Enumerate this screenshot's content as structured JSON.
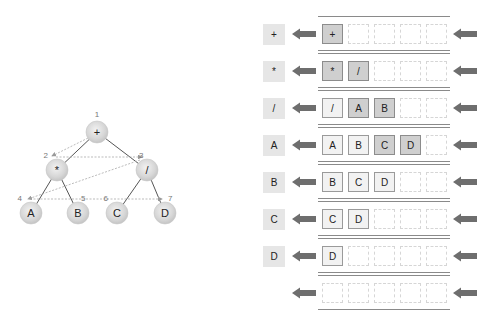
{
  "tree": {
    "nodes": [
      {
        "id": "plus",
        "label": "+",
        "order": "1",
        "x": 97,
        "y": 132
      },
      {
        "id": "mul",
        "label": "*",
        "order": "2",
        "x": 57,
        "y": 170
      },
      {
        "id": "div",
        "label": "/",
        "order": "3",
        "x": 147,
        "y": 170
      },
      {
        "id": "A",
        "label": "A",
        "order": "4",
        "x": 31,
        "y": 213
      },
      {
        "id": "B",
        "label": "B",
        "order": "5",
        "x": 78,
        "y": 213
      },
      {
        "id": "C",
        "label": "C",
        "order": "6",
        "x": 117,
        "y": 213
      },
      {
        "id": "D",
        "label": "D",
        "order": "7",
        "x": 165,
        "y": 213
      }
    ],
    "edges": [
      [
        "plus",
        "mul"
      ],
      [
        "plus",
        "div"
      ],
      [
        "mul",
        "A"
      ],
      [
        "mul",
        "B"
      ],
      [
        "div",
        "C"
      ],
      [
        "div",
        "D"
      ]
    ],
    "traversal_order": [
      "+",
      "*",
      "/",
      "A",
      "B",
      "C",
      "D"
    ]
  },
  "queue_steps": [
    {
      "output": "+",
      "cells": [
        {
          "v": "+",
          "s": "new"
        }
      ]
    },
    {
      "output": "*",
      "cells": [
        {
          "v": "*",
          "s": "new"
        },
        {
          "v": "/",
          "s": "new"
        }
      ]
    },
    {
      "output": "/",
      "cells": [
        {
          "v": "/",
          "s": "filled"
        },
        {
          "v": "A",
          "s": "new"
        },
        {
          "v": "B",
          "s": "new"
        }
      ]
    },
    {
      "output": "A",
      "cells": [
        {
          "v": "A",
          "s": "filled"
        },
        {
          "v": "B",
          "s": "filled"
        },
        {
          "v": "C",
          "s": "new"
        },
        {
          "v": "D",
          "s": "new"
        }
      ]
    },
    {
      "output": "B",
      "cells": [
        {
          "v": "B",
          "s": "filled"
        },
        {
          "v": "C",
          "s": "filled"
        },
        {
          "v": "D",
          "s": "filled"
        }
      ]
    },
    {
      "output": "C",
      "cells": [
        {
          "v": "C",
          "s": "filled"
        },
        {
          "v": "D",
          "s": "filled"
        }
      ]
    },
    {
      "output": "D",
      "cells": [
        {
          "v": "D",
          "s": "filled"
        }
      ]
    },
    {
      "output": "",
      "cells": []
    }
  ],
  "queue_capacity": 5,
  "colors": {
    "node_fill": "#d9d9d9",
    "edge": "#555555",
    "traversal_arrow": "#aaaaaa",
    "arrow": "#6e6e6e",
    "new_cell": "#cfcfcf",
    "filled_cell": "#f2f2f2",
    "output_box": "#e6e6e6"
  }
}
